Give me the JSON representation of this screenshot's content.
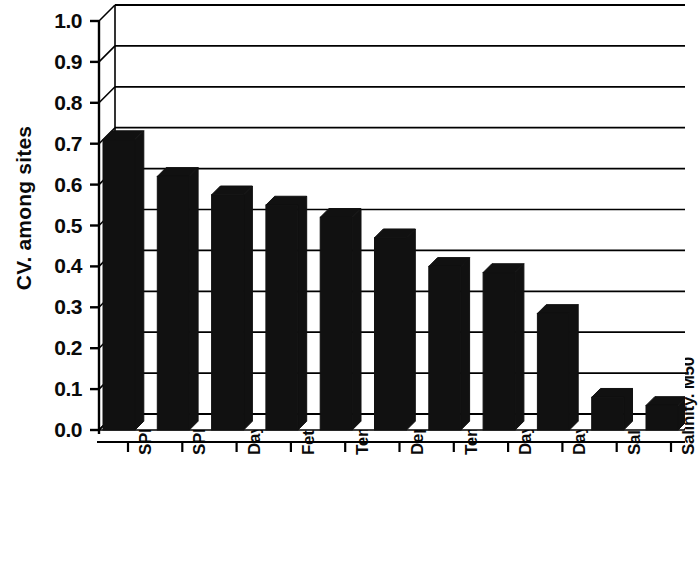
{
  "chart_data": {
    "type": "bar",
    "title": "",
    "xlabel": "",
    "ylabel": "CV. among sites",
    "ylim": [
      0.0,
      1.0
    ],
    "grid": true,
    "legend": "none",
    "style": "3d-bar",
    "bar_color": "#111111",
    "background_color": "#ffffff",
    "axis_color": "#000000",
    "categories": [
      "SPM. M50",
      "SPM. MV",
      "Days, 5",
      "Fetch",
      "Temp. M50",
      "Depth",
      "Temp. MV",
      "Days, 7",
      "Days, 10",
      "Salinity. MV",
      "Salinity. M50"
    ],
    "values": [
      0.71,
      0.62,
      0.575,
      0.55,
      0.52,
      0.47,
      0.4,
      0.385,
      0.285,
      0.08,
      0.06
    ],
    "ytick_labels": [
      "1.0",
      "0.9",
      "0.8",
      "0.7",
      "0.6",
      "0.5",
      "0.4",
      "0.3",
      "0.2",
      "0.1",
      "0.0"
    ],
    "ytick_values": [
      1.0,
      0.9,
      0.8,
      0.7,
      0.6,
      0.5,
      0.4,
      0.3,
      0.2,
      0.1,
      0.0
    ]
  }
}
